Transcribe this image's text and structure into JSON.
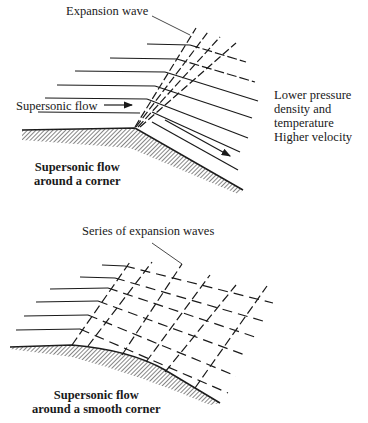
{
  "figure_top": {
    "title": "Supersonic flow\naround a corner",
    "labels": {
      "expansion_wave": "Expansion wave",
      "supersonic_flow": "Supersonic flow",
      "downstream_conditions": "Lower pressure\ndensity and\ntemperature\nHigher velocity"
    }
  },
  "figure_bottom": {
    "title": "Supersonic flow\naround a smooth corner",
    "labels": {
      "series_of_waves": "Series of expansion waves"
    }
  },
  "colors": {
    "line": "#1a1a1a",
    "background": "#ffffff"
  }
}
